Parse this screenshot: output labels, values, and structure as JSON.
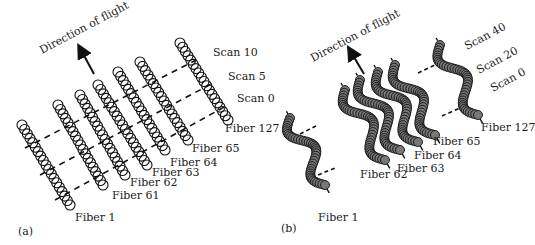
{
  "figure": {
    "panels": [
      {
        "id": "a",
        "panel_label": "(a)",
        "direction_label": "Direction of flight",
        "scan_labels": [
          "Scan 10",
          "Scan 5",
          "Scan 0"
        ],
        "fiber_labels": [
          "Fiber 127",
          "Fiber 65",
          "Fiber 64",
          "Fiber 63",
          "Fiber 62",
          "Fiber 61",
          "Fiber 1"
        ],
        "fiber_shape": "straight"
      },
      {
        "id": "b",
        "panel_label": "(b)",
        "direction_label": "Direction of flight",
        "scan_labels": [
          "Scan 40",
          "Scan 20",
          "Scan 0"
        ],
        "fiber_labels": [
          "Fiber 127",
          "Fiber 65",
          "Fiber 64",
          "Fiber 63",
          "Fiber 62",
          "Fiber 1"
        ],
        "fiber_shape": "wavy"
      }
    ],
    "colors": {
      "ink": "#222222",
      "background": "#ffffff"
    }
  }
}
